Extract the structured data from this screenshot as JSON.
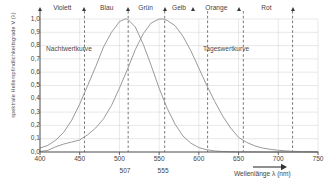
{
  "chart_data": {
    "type": "line",
    "title": "",
    "xlabel": "Wellenlänge  λ (nm)",
    "ylabel": "spektrale Hellempfindlichkeitsgrade V (λ)",
    "xlim": [
      400,
      750
    ],
    "ylim": [
      0.0,
      1.0
    ],
    "grid": true,
    "legend": "inline-annotations",
    "xticks": [
      "400",
      "450",
      "500",
      "550",
      "600",
      "650",
      "700",
      "750"
    ],
    "xtick_values": [
      400,
      450,
      500,
      550,
      600,
      650,
      700,
      750
    ],
    "yticks": [
      "0,0",
      "0,1",
      "0,2",
      "0,3",
      "0,4",
      "0,5",
      "0,6",
      "0,7",
      "0,8",
      "0,9",
      "1,0"
    ],
    "ytick_values": [
      0.0,
      0.1,
      0.2,
      0.3,
      0.4,
      0.5,
      0.6,
      0.7,
      0.8,
      0.9,
      1.0
    ],
    "annotations_below_axis": [
      {
        "label": "507",
        "x": 507
      },
      {
        "label": "555",
        "x": 555
      }
    ],
    "series": [
      {
        "name": "Nachtwertkurve",
        "peak_x": 507,
        "peak_y": 1.0,
        "color": "#9a9a9a",
        "x": [
          400,
          410,
          420,
          430,
          440,
          450,
          460,
          470,
          480,
          490,
          500,
          507,
          510,
          520,
          530,
          540,
          550,
          560,
          570,
          580,
          590,
          600,
          610,
          620,
          630,
          640,
          650,
          660,
          680,
          700,
          720,
          750
        ],
        "y": [
          0.03,
          0.05,
          0.09,
          0.15,
          0.24,
          0.36,
          0.5,
          0.64,
          0.79,
          0.9,
          0.98,
          1.0,
          1.0,
          0.94,
          0.81,
          0.65,
          0.48,
          0.33,
          0.21,
          0.12,
          0.066,
          0.033,
          0.017,
          0.008,
          0.004,
          0.002,
          0.001,
          0.001,
          0.0,
          0.0,
          0.0,
          0.0
        ]
      },
      {
        "name": "Tageswertkurve",
        "peak_x": 555,
        "peak_y": 1.0,
        "color": "#9a9a9a",
        "x": [
          400,
          410,
          420,
          430,
          440,
          450,
          460,
          470,
          480,
          490,
          500,
          510,
          520,
          530,
          540,
          550,
          555,
          560,
          570,
          580,
          590,
          600,
          610,
          620,
          630,
          640,
          650,
          660,
          670,
          680,
          690,
          700,
          710,
          720,
          730,
          740,
          750
        ],
        "y": [
          0.004,
          0.012,
          0.04,
          0.06,
          0.075,
          0.09,
          0.13,
          0.18,
          0.25,
          0.35,
          0.48,
          0.62,
          0.77,
          0.89,
          0.97,
          1.0,
          1.0,
          0.99,
          0.95,
          0.87,
          0.76,
          0.63,
          0.5,
          0.38,
          0.27,
          0.18,
          0.11,
          0.073,
          0.047,
          0.03,
          0.02,
          0.013,
          0.008,
          0.005,
          0.003,
          0.002,
          0.001
        ]
      }
    ],
    "color_bands": [
      {
        "label": "Violett",
        "center_x": 428,
        "marker_x": 400
      },
      {
        "label": "Blau",
        "center_x": 484,
        "marker_x": 456
      },
      {
        "label": "Grün",
        "center_x": 533,
        "marker_x": 511
      },
      {
        "label": "Gelb",
        "center_x": 575,
        "marker_x": 557
      },
      {
        "label": "Orange",
        "center_x": 622,
        "marker_x": 593
      },
      {
        "label": "Rot",
        "center_x": 685,
        "marker_x": 651
      }
    ],
    "band_markers": [
      400,
      456,
      511,
      557,
      593,
      651,
      718
    ],
    "dashed_guides": [
      456,
      511,
      557,
      611,
      656,
      718
    ],
    "colors": {
      "curve": "#9a9a9a",
      "grid": "#d8d8d8",
      "axis": "#555555",
      "dashed": "#555555",
      "text": "#444444",
      "background": "#ffffff"
    }
  }
}
